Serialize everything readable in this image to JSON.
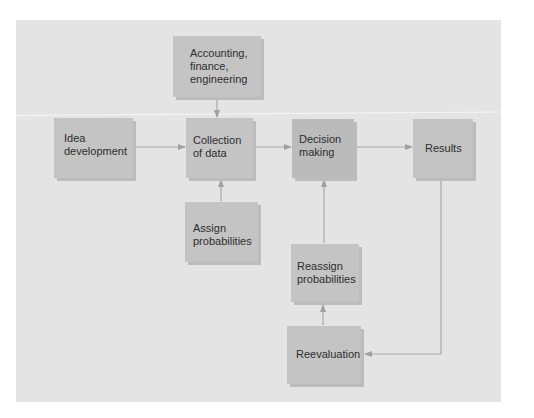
{
  "diagram": {
    "type": "flowchart",
    "nodes": [
      {
        "id": "accounting",
        "label": "Accounting,\nfinance,\nengineering"
      },
      {
        "id": "idea",
        "label": "Idea\ndevelopment"
      },
      {
        "id": "collection",
        "label": "Collection\nof data"
      },
      {
        "id": "decision",
        "label": "Decision\nmaking"
      },
      {
        "id": "results",
        "label": "Results"
      },
      {
        "id": "assign",
        "label": "Assign\nprobabilities"
      },
      {
        "id": "reassign",
        "label": "Reassign\nprobabilities"
      },
      {
        "id": "reevaluation",
        "label": "Reevaluation"
      }
    ],
    "edges": [
      {
        "from": "accounting",
        "to": "collection"
      },
      {
        "from": "idea",
        "to": "collection"
      },
      {
        "from": "assign",
        "to": "collection"
      },
      {
        "from": "collection",
        "to": "decision"
      },
      {
        "from": "decision",
        "to": "results"
      },
      {
        "from": "results",
        "to": "reevaluation"
      },
      {
        "from": "reevaluation",
        "to": "reassign"
      },
      {
        "from": "reassign",
        "to": "decision"
      }
    ],
    "colors": {
      "background": "#e4e4e4",
      "box": "#c4c4c4",
      "box_dark": "#bbbbbb",
      "arrow": "#a0a0a0",
      "text": "#2e2e2e"
    }
  }
}
